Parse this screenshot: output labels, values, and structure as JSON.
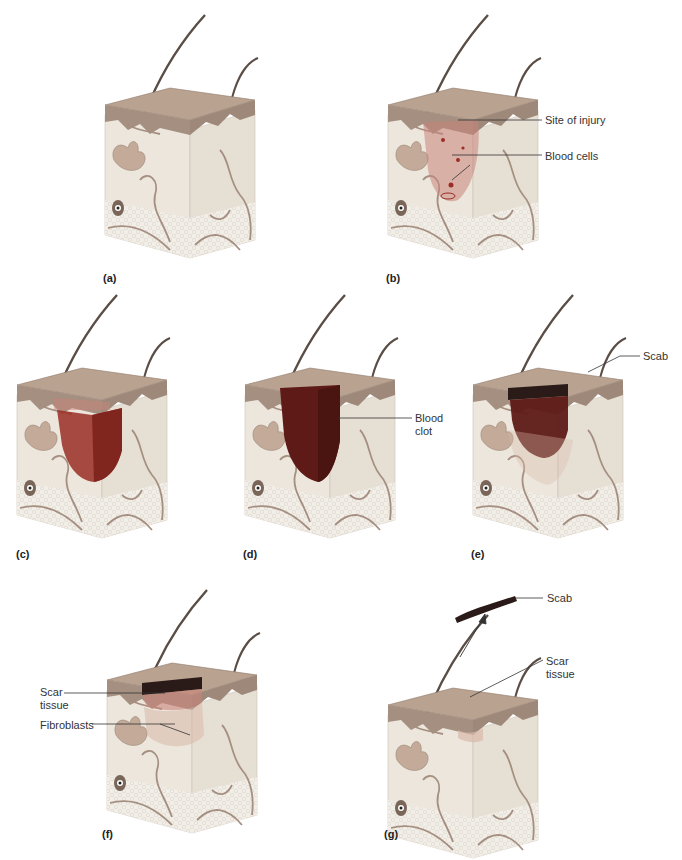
{
  "figure": {
    "colors": {
      "epidermis_top": "#b9a28f",
      "epidermis_side": "#a48f80",
      "dermis": "#ece6dc",
      "hypodermis": "#f2efe9",
      "vessel": "#a58f80",
      "hair": "#5a4d45",
      "gland": "#c3aa99",
      "injury": "#c9847a",
      "blood": "#9a2d25",
      "clot": "#5e1a16",
      "scab": "#2b1b18",
      "scar": "#d9b8a8",
      "leader": "#333333"
    },
    "panels": [
      {
        "id": "a",
        "label": "(a)",
        "callouts": []
      },
      {
        "id": "b",
        "label": "(b)",
        "callouts": [
          {
            "text": "Site of injury"
          },
          {
            "text": "Blood cells"
          }
        ]
      },
      {
        "id": "c",
        "label": "(c)",
        "callouts": []
      },
      {
        "id": "d",
        "label": "(d)",
        "callouts": [
          {
            "text": "Blood\nclot"
          }
        ]
      },
      {
        "id": "e",
        "label": "(e)",
        "callouts": [
          {
            "text": "Scab"
          }
        ]
      },
      {
        "id": "f",
        "label": "(f)",
        "callouts": [
          {
            "text": "Scar\ntissue"
          },
          {
            "text": "Fibroblasts"
          }
        ]
      },
      {
        "id": "g",
        "label": "(g)",
        "callouts": [
          {
            "text": "Scab"
          },
          {
            "text": "Scar\ntissue"
          }
        ]
      }
    ]
  }
}
